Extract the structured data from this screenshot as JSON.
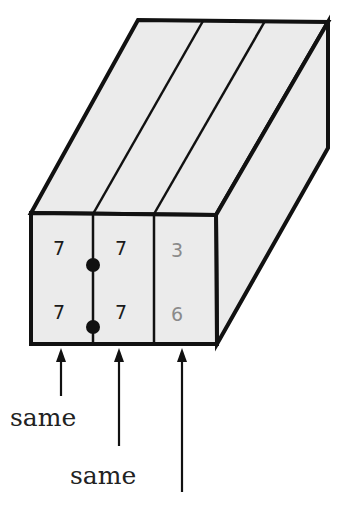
{
  "diagram": {
    "colors": {
      "face_fill": "#ebebeb",
      "outline": "#111111",
      "value_dark": "#1a1a1a",
      "value_gray": "#8a8a8a"
    },
    "columns": [
      {
        "id": "col1",
        "top": "7",
        "bottom": "7",
        "color": "#1a1a1a"
      },
      {
        "id": "col2",
        "top": "7",
        "bottom": "7",
        "color": "#1a1a1a"
      },
      {
        "id": "col3",
        "top": "3",
        "bottom": "6",
        "color": "#8a8a8a"
      }
    ],
    "connector": {
      "between": [
        "col1",
        "col2"
      ],
      "dots": 2
    },
    "labels": [
      {
        "text": "same",
        "for": "col1"
      },
      {
        "text": "same",
        "for": "col2"
      },
      {
        "text": "",
        "for": "col3"
      }
    ]
  }
}
